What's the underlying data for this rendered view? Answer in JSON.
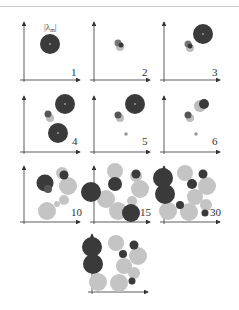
{
  "figure": {
    "lambda_label": "|λ_m|",
    "lambda_main": "λ",
    "lambda_sub": "m",
    "colors": {
      "dark": "#3a3a3a",
      "light": "#bdbdbd",
      "axis": "#333333",
      "topline": "#c8c8c8"
    },
    "panels": [
      {
        "label": "1"
      },
      {
        "label": "2"
      },
      {
        "label": "3"
      },
      {
        "label": "4"
      },
      {
        "label": "5"
      },
      {
        "label": "6"
      },
      {
        "label": "10"
      },
      {
        "label": "15"
      },
      {
        "label": "30"
      },
      {
        "label": ""
      }
    ]
  }
}
